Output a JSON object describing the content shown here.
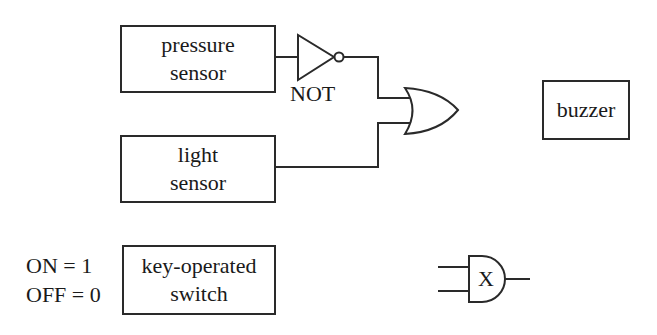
{
  "diagram": {
    "blocks": {
      "pressure_sensor": {
        "line1": "pressure",
        "line2": "sensor"
      },
      "light_sensor": {
        "line1": "light",
        "line2": "sensor"
      },
      "buzzer": {
        "label": "buzzer"
      },
      "key_switch": {
        "line1": "key-operated",
        "line2": "switch"
      }
    },
    "gates": {
      "not_gate": {
        "type": "NOT",
        "label": "NOT"
      },
      "or_gate": {
        "type": "OR"
      },
      "x_gate": {
        "type": "AND",
        "label": "X"
      }
    },
    "switch_states": {
      "on": "ON = 1",
      "off": "OFF = 0"
    },
    "colors": {
      "line": "#2a2a2a",
      "background": "#ffffff"
    }
  }
}
